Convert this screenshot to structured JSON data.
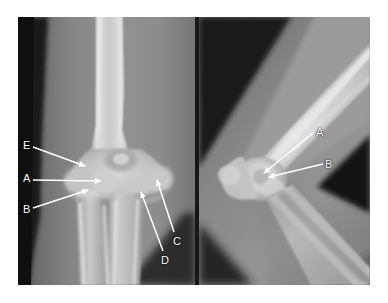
{
  "figure": {
    "kind": "radiograph-figure",
    "modality": "X-ray",
    "body_part": "elbow",
    "panel_count": 2,
    "background_color": "#ffffff",
    "label_color": "#ffffff",
    "arrow_color": "#ffffff"
  },
  "panels": [
    {
      "id": "ap",
      "name": "anteroposterior-elbow-radiograph",
      "view": "AP",
      "frame": {
        "x": 18,
        "y": 17,
        "w": 177,
        "h": 268
      },
      "labels": [
        {
          "key": "E",
          "text": "E",
          "x": 23,
          "y": 140,
          "tip_x": 85,
          "tip_y": 166
        },
        {
          "key": "A",
          "text": "A",
          "x": 23,
          "y": 173,
          "tip_x": 101,
          "tip_y": 181
        },
        {
          "key": "B",
          "text": "B",
          "x": 23,
          "y": 204,
          "tip_x": 88,
          "tip_y": 190
        },
        {
          "key": "C",
          "text": "C",
          "x": 173,
          "y": 236,
          "tip_x": 157,
          "tip_y": 180
        },
        {
          "key": "D",
          "text": "D",
          "x": 161,
          "y": 255,
          "tip_x": 141,
          "tip_y": 192
        }
      ]
    },
    {
      "id": "lateral",
      "name": "lateral-elbow-radiograph",
      "view": "Lateral",
      "frame": {
        "x": 199,
        "y": 17,
        "w": 171,
        "h": 268
      },
      "labels": [
        {
          "key": "A",
          "text": "A",
          "x": 316,
          "y": 127,
          "tip_x": 263,
          "tip_y": 173
        },
        {
          "key": "B",
          "text": "B",
          "x": 325,
          "y": 159,
          "tip_x": 268,
          "tip_y": 177
        }
      ]
    }
  ],
  "leader_lines": [
    {
      "panel": "ap",
      "key": "E",
      "x1": 33,
      "y1": 147,
      "x2": 85,
      "y2": 166
    },
    {
      "panel": "ap",
      "key": "A",
      "x1": 33,
      "y1": 180,
      "x2": 101,
      "y2": 181
    },
    {
      "panel": "ap",
      "key": "B",
      "x1": 33,
      "y1": 208,
      "x2": 88,
      "y2": 190
    },
    {
      "panel": "ap",
      "key": "C",
      "x1": 174,
      "y1": 232,
      "x2": 157,
      "y2": 180
    },
    {
      "panel": "ap",
      "key": "D",
      "x1": 163,
      "y1": 251,
      "x2": 141,
      "y2": 192
    },
    {
      "panel": "lateral",
      "key": "A",
      "x1": 314,
      "y1": 132,
      "x2": 263,
      "y2": 173
    },
    {
      "panel": "lateral",
      "key": "B",
      "x1": 323,
      "y1": 164,
      "x2": 268,
      "y2": 177
    }
  ],
  "palette": {
    "film_background": "#6e6e6e",
    "soft_tissue": "#8f8f8f",
    "bone_mid": "#c0c0c0",
    "bone_bright": "#e6e6e6",
    "cortex": "#f2f2f2",
    "dark_collimation": "#1b1b1b",
    "divider": "#171717",
    "page": "#ffffff"
  }
}
